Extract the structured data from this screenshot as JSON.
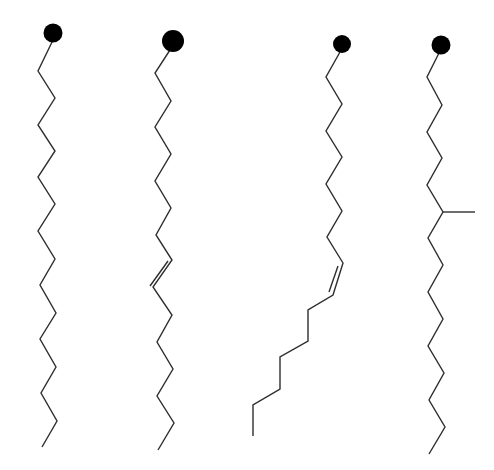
{
  "diagram": {
    "width": 494,
    "height": 470,
    "background": "#ffffff",
    "stroke_color": "#2e2e2e",
    "stroke_width": 1.4,
    "head_color": "#000000",
    "molecules": [
      {
        "name": "saturated-chain",
        "head": {
          "cx": 53,
          "cy": 33,
          "r": 9.5
        },
        "chain": [
          [
            53,
            40
          ],
          [
            38,
            71
          ],
          [
            55,
            98
          ],
          [
            38,
            125
          ],
          [
            55,
            151
          ],
          [
            38,
            177
          ],
          [
            55,
            204
          ],
          [
            38,
            231
          ],
          [
            55,
            259
          ],
          [
            40,
            285
          ],
          [
            56,
            313
          ],
          [
            40,
            339
          ],
          [
            56,
            367
          ],
          [
            41,
            393
          ],
          [
            57,
            421
          ],
          [
            42,
            447
          ]
        ],
        "double_bonds": [],
        "branches": []
      },
      {
        "name": "trans-unsaturated-chain",
        "head": {
          "cx": 173,
          "cy": 41,
          "r": 11
        },
        "chain": [
          [
            170,
            50
          ],
          [
            155,
            73
          ],
          [
            171,
            101
          ],
          [
            155,
            127
          ],
          [
            171,
            154
          ],
          [
            155,
            181
          ],
          [
            171,
            208
          ],
          [
            156,
            235
          ],
          [
            172,
            260
          ],
          [
            153,
            287
          ],
          [
            172,
            315
          ],
          [
            157,
            342
          ],
          [
            173,
            369
          ],
          [
            157,
            396
          ],
          [
            174,
            423
          ],
          [
            158,
            450
          ]
        ],
        "double_bonds": [
          {
            "from": [
              168,
              261
            ],
            "to": [
              150,
              286
            ]
          }
        ],
        "branches": []
      },
      {
        "name": "cis-unsaturated-chain",
        "head": {
          "cx": 342,
          "cy": 44,
          "r": 9
        },
        "chain": [
          [
            340,
            52
          ],
          [
            326,
            77
          ],
          [
            342,
            104
          ],
          [
            326,
            131
          ],
          [
            342,
            157
          ],
          [
            326,
            184
          ],
          [
            342,
            211
          ],
          [
            327,
            237
          ],
          [
            343,
            263
          ],
          [
            333,
            295
          ],
          [
            308,
            310
          ],
          [
            308,
            341
          ],
          [
            280,
            357
          ],
          [
            280,
            389
          ],
          [
            253,
            405
          ],
          [
            253,
            436
          ]
        ],
        "double_bonds": [
          {
            "from": [
              338,
              266
            ],
            "to": [
              329,
              292
            ]
          }
        ],
        "branches": []
      },
      {
        "name": "branched-chain",
        "head": {
          "cx": 441,
          "cy": 45,
          "r": 9.5
        },
        "chain": [
          [
            439,
            53
          ],
          [
            427,
            77
          ],
          [
            442,
            105
          ],
          [
            427,
            132
          ],
          [
            442,
            158
          ],
          [
            427,
            185
          ],
          [
            443,
            212
          ],
          [
            428,
            238
          ],
          [
            443,
            265
          ],
          [
            428,
            292
          ],
          [
            443,
            319
          ],
          [
            428,
            346
          ],
          [
            444,
            373
          ],
          [
            429,
            400
          ],
          [
            445,
            427
          ],
          [
            429,
            454
          ]
        ],
        "double_bonds": [],
        "branches": [
          {
            "from": [
              443,
              212
            ],
            "to": [
              475,
              212
            ]
          }
        ]
      }
    ]
  }
}
